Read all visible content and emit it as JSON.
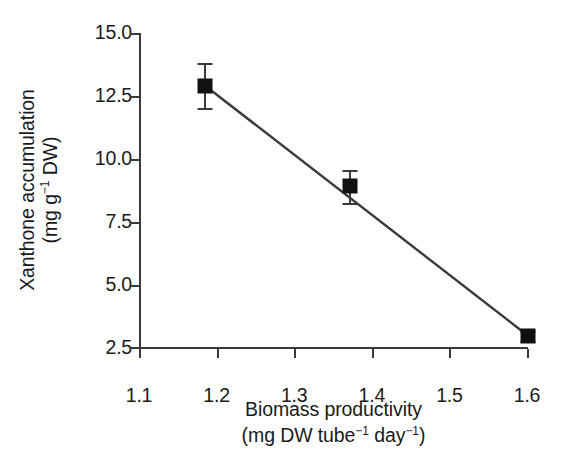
{
  "chart_data": {
    "type": "scatter",
    "title": "",
    "xlabel": "Biomass productivity (mg DW tube⁻¹ day⁻¹)",
    "ylabel": "Xanthone accumulation (mg g⁻¹ DW)",
    "xlabel_line1": "Biomass productivity",
    "xlabel_line2_prefix": "(mg DW tube",
    "xlabel_line2_sup1": "−1",
    "xlabel_line2_mid": " day",
    "xlabel_line2_sup2": "−1",
    "xlabel_line2_suffix": ")",
    "ylabel_line1": "Xanthone accumulation",
    "ylabel_line2_prefix": "(mg g",
    "ylabel_line2_sup": "−1",
    "ylabel_line2_suffix": " DW)",
    "xlim": [
      1.1,
      1.6
    ],
    "ylim": [
      2.5,
      15.0
    ],
    "xticks": [
      1.1,
      1.2,
      1.3,
      1.4,
      1.5,
      1.6
    ],
    "xticklabels": [
      "1.1",
      "1.2",
      "1.3",
      "1.4",
      "1.5",
      "1.6"
    ],
    "yticks": [
      2.5,
      5.0,
      7.5,
      10.0,
      12.5,
      15.0
    ],
    "yticklabels": [
      "2.5",
      "5.0",
      "7.5",
      "10.0",
      "12.5",
      "15.0"
    ],
    "grid": false,
    "legend": "none",
    "marker_style": "filled-square",
    "marker_color": "#111111",
    "line_color": "#3a3a3a",
    "axis_color": "#3a3a3a",
    "background": "#ffffff",
    "x": [
      1.185,
      1.371,
      1.6
    ],
    "y": [
      12.9,
      8.9,
      2.95
    ],
    "yerr": [
      0.9,
      0.65,
      0.2
    ],
    "points": [
      {
        "x": 1.185,
        "y": 12.9,
        "yerr": 0.9
      },
      {
        "x": 1.371,
        "y": 8.9,
        "yerr": 0.65
      },
      {
        "x": 1.6,
        "y": 2.95,
        "yerr": 0.2
      }
    ],
    "trendline": {
      "type": "linear-fit",
      "x_start": 1.185,
      "y_start": 12.9,
      "x_end": 1.6,
      "y_end": 2.95
    }
  }
}
